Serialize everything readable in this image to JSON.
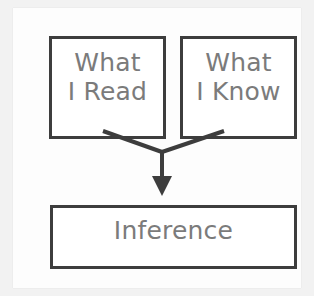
{
  "diagram": {
    "type": "flowchart",
    "orientation": "top-down-converging",
    "colors": {
      "box_border": "#3d3d3d",
      "box_fill": "#ffffff",
      "text": "#7b7b7b",
      "connector": "#3d3d3d",
      "page": "#fdfdfd",
      "scan_margin": "#f2f2f2"
    },
    "nodes": [
      {
        "id": "what-i-read",
        "label": "What\nI Read",
        "role": "source",
        "position": "top-left"
      },
      {
        "id": "what-i-know",
        "label": "What\nI Know",
        "role": "source",
        "position": "top-right"
      },
      {
        "id": "inference",
        "label": "Inference",
        "role": "result",
        "position": "bottom"
      }
    ],
    "edges": [
      {
        "id": "edge-read-to-inference",
        "from": "what-i-read",
        "to": "inference",
        "style": "line",
        "arrowhead": false
      },
      {
        "id": "edge-know-to-inference",
        "from": "what-i-know",
        "to": "inference",
        "style": "line",
        "arrowhead": false
      },
      {
        "id": "edge-merge-to-inference",
        "from": "merge-point",
        "to": "inference",
        "style": "line",
        "arrowhead": true
      }
    ]
  }
}
